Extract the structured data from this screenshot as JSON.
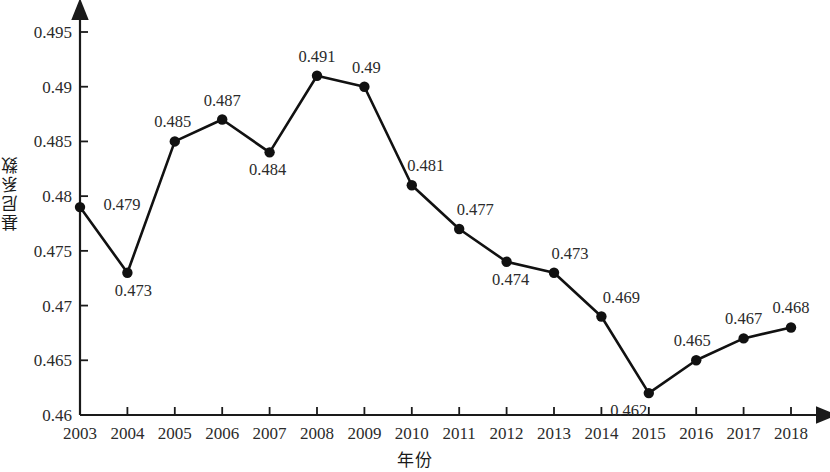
{
  "chart_data": {
    "type": "line",
    "title": "",
    "xlabel": "年份",
    "ylabel": "基尼系数",
    "grid": false,
    "legend": null,
    "marker": "filled-circle",
    "line_color": "#111111",
    "categories": [
      "2003",
      "2004",
      "2005",
      "2006",
      "2007",
      "2008",
      "2009",
      "2010",
      "2011",
      "2012",
      "2013",
      "2014",
      "2015",
      "2016",
      "2017",
      "2018"
    ],
    "values": [
      0.479,
      0.473,
      0.485,
      0.487,
      0.484,
      0.491,
      0.49,
      0.481,
      0.477,
      0.474,
      0.473,
      0.469,
      0.462,
      0.465,
      0.467,
      0.468
    ],
    "point_labels": [
      "0.479",
      "0.473",
      "0.485",
      "0.487",
      "0.484",
      "0.491",
      "0.49",
      "0.481",
      "0.477",
      "0.474",
      "0.473",
      "0.469",
      "0.462",
      "0.465",
      "0.467",
      "0.468"
    ],
    "xlim": [
      2003,
      2018
    ],
    "ylim": [
      0.46,
      0.495
    ],
    "ytick_values": [
      0.46,
      0.465,
      0.47,
      0.475,
      0.48,
      0.485,
      0.49,
      0.495
    ],
    "ytick_labels": [
      "0.46",
      "0.465",
      "0.47",
      "0.475",
      "0.48",
      "0.485",
      "0.49",
      "0.495"
    ],
    "xtick_labels": [
      "2003",
      "2004",
      "2005",
      "2006",
      "2007",
      "2008",
      "2009",
      "2010",
      "2011",
      "2012",
      "2013",
      "2014",
      "2015",
      "2016",
      "2017",
      "2018"
    ],
    "label_placement": [
      "right",
      "below",
      "above",
      "above",
      "below",
      "above",
      "above",
      "above",
      "above",
      "below",
      "above",
      "above",
      "below",
      "above",
      "above",
      "above"
    ]
  },
  "axes": {
    "x_title": "年份",
    "y_title": "基尼系数",
    "x_arrow": true,
    "y_arrow": true,
    "axis_color": "#1a1a1a"
  }
}
